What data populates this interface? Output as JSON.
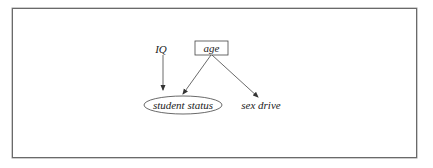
{
  "diagram": {
    "type": "causal-graph",
    "nodes": [
      {
        "id": "iq",
        "label": "IQ",
        "shape": "none"
      },
      {
        "id": "age",
        "label": "age",
        "shape": "rectangle"
      },
      {
        "id": "student_status",
        "label": "student status",
        "shape": "ellipse"
      },
      {
        "id": "sex_drive",
        "label": "sex drive",
        "shape": "none"
      }
    ],
    "edges": [
      {
        "from": "iq",
        "to": "student_status"
      },
      {
        "from": "age",
        "to": "student_status"
      },
      {
        "from": "age",
        "to": "sex_drive"
      }
    ]
  },
  "colors": {
    "stroke": "#333333",
    "frame": "#6a6a6a",
    "text": "#222222"
  }
}
